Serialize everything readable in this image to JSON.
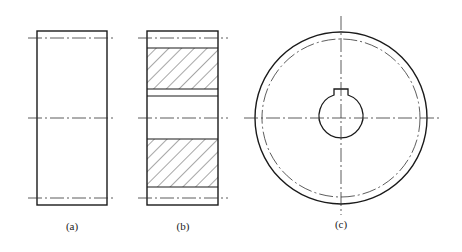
{
  "figure": {
    "views": [
      {
        "id": "a",
        "label": "(a)",
        "description": "Gear front view (outline)"
      },
      {
        "id": "b",
        "label": "(b)",
        "description": "Gear sectional view with hatching"
      },
      {
        "id": "c",
        "label": "(c)",
        "description": "Gear side view with keyway hub"
      }
    ]
  },
  "colors": {
    "line": "#1a1a1a",
    "centerline": "#333333",
    "background": "#ffffff"
  }
}
